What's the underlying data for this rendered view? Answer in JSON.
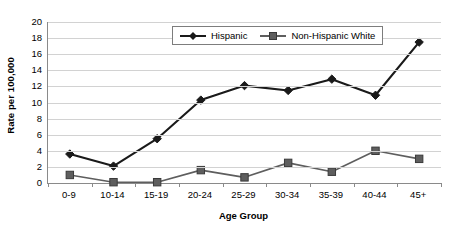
{
  "chart_data": {
    "type": "line",
    "title": "",
    "xlabel": "Age Group",
    "ylabel": "Rate per 100,000",
    "categories": [
      "0-9",
      "10-14",
      "15-19",
      "20-24",
      "25-29",
      "30-34",
      "35-39",
      "40-44",
      "45+"
    ],
    "ylim": [
      0,
      20
    ],
    "ytick_step": 2,
    "yticks": [
      20,
      18,
      16,
      14,
      12,
      10,
      8,
      6,
      4,
      2,
      0
    ],
    "grid": true,
    "legend_position": "top-center",
    "series": [
      {
        "name": "Hispanic",
        "marker": "diamond",
        "color": "#1a1a1a",
        "values": [
          3.6,
          2.1,
          5.5,
          10.3,
          12.1,
          11.5,
          12.9,
          10.9,
          17.5
        ]
      },
      {
        "name": "Non-Hispanic White",
        "marker": "square",
        "color": "#5e5e5e",
        "values": [
          1.0,
          0.1,
          0.1,
          1.6,
          0.7,
          2.5,
          1.4,
          4.0,
          3.0
        ]
      }
    ]
  },
  "axes": {
    "y_title": "Rate per 100,000",
    "x_title": "Age Group"
  },
  "legend": {
    "items": [
      {
        "label": "Hispanic"
      },
      {
        "label": "Non-Hispanic White"
      }
    ]
  },
  "colors": {
    "series_hispanic": "#1a1a1a",
    "series_non_hispanic_white": "#5e5e5e",
    "gridline": "#d2d2d2",
    "axis": "#8a8a8a",
    "background": "#ffffff"
  }
}
